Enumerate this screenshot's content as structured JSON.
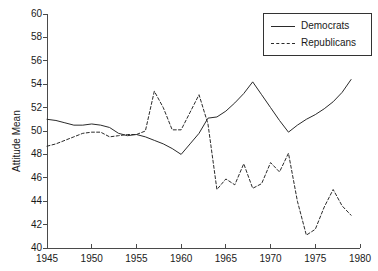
{
  "chart_data": {
    "type": "line",
    "title": "",
    "xlabel": "",
    "ylabel": "Attitude Mean",
    "xlim": [
      1945,
      1980
    ],
    "ylim": [
      40,
      60
    ],
    "grid": false,
    "legend_position": "top-right",
    "xticks": [
      1945,
      1950,
      1955,
      1960,
      1965,
      1970,
      1975,
      1980
    ],
    "yticks": [
      40,
      42,
      44,
      46,
      48,
      50,
      52,
      54,
      56,
      58,
      60
    ],
    "series": [
      {
        "name": "Democrats",
        "style": "solid",
        "color": "#2a2a2a",
        "x": [
          1945,
          1946,
          1947,
          1948,
          1949,
          1950,
          1951,
          1952,
          1953,
          1954,
          1955,
          1956,
          1957,
          1958,
          1959,
          1960,
          1961,
          1962,
          1963,
          1964,
          1965,
          1966,
          1967,
          1968,
          1969,
          1970,
          1971,
          1972,
          1973,
          1974,
          1975,
          1976,
          1977,
          1978,
          1979
        ],
        "y": [
          51.0,
          50.9,
          50.7,
          50.5,
          50.5,
          50.6,
          50.5,
          50.3,
          49.8,
          49.6,
          49.7,
          49.5,
          49.2,
          48.9,
          48.5,
          48.0,
          48.9,
          49.8,
          51.1,
          51.2,
          51.7,
          52.4,
          53.2,
          54.2,
          53.1,
          52.0,
          50.9,
          49.9,
          50.5,
          51.0,
          51.4,
          51.9,
          52.5,
          53.3,
          54.4
        ]
      },
      {
        "name": "Republicans",
        "style": "dashed",
        "color": "#2a2a2a",
        "x": [
          1945,
          1946,
          1947,
          1948,
          1949,
          1950,
          1951,
          1952,
          1953,
          1954,
          1955,
          1956,
          1957,
          1958,
          1959,
          1960,
          1961,
          1962,
          1963,
          1964,
          1965,
          1966,
          1967,
          1968,
          1969,
          1970,
          1971,
          1972,
          1973,
          1974,
          1975,
          1976,
          1977,
          1978,
          1979
        ],
        "y": [
          48.7,
          48.9,
          49.2,
          49.5,
          49.8,
          49.9,
          49.9,
          49.5,
          49.6,
          49.7,
          49.7,
          50.0,
          53.4,
          52.0,
          50.1,
          50.1,
          51.6,
          53.1,
          50.6,
          45.0,
          45.9,
          45.4,
          47.2,
          45.1,
          45.5,
          47.3,
          46.5,
          48.1,
          44.0,
          41.1,
          41.6,
          43.5,
          45.0,
          43.6,
          42.8
        ]
      }
    ]
  },
  "axis": {
    "y_title": "Attitude Mean"
  },
  "legend": {
    "items": [
      {
        "label": "Democrats",
        "style": "solid"
      },
      {
        "label": "Republicans",
        "style": "dashed"
      }
    ]
  }
}
